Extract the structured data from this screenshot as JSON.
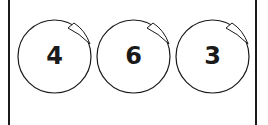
{
  "balls": [
    {
      "label": "4",
      "left": 17
    },
    {
      "label": "6",
      "left": 96
    },
    {
      "label": "3",
      "left": 175
    }
  ],
  "colors": {
    "stroke": "#1a1a1a",
    "background": "#ffffff"
  }
}
